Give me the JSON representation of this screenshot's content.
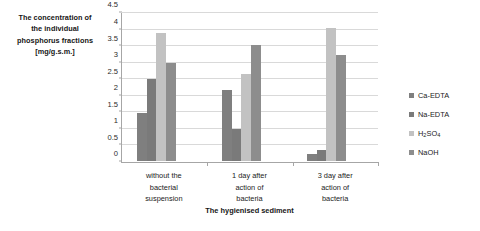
{
  "chart_data": {
    "type": "bar",
    "title": "",
    "subtitle": "",
    "xlabel": "The hygienised sediment",
    "ylabel": "The concentration of the individual phosphorus fractions [mg/g.s.m.]",
    "ylabel_lines": [
      "The concentration of",
      "the individual",
      "phosphorus fractions",
      "[mg/g.s.m.]"
    ],
    "categories": [
      "without the bacterial suspension",
      "1 day after action of bacteria",
      "3 day after action of bacteria"
    ],
    "category_label_lines": [
      [
        "without the",
        "bacterial",
        "suspension"
      ],
      [
        "1 day after",
        "action of",
        "bacteria"
      ],
      [
        "3 day after",
        "action of",
        "bacteria"
      ]
    ],
    "series": [
      {
        "name": "Ca-EDTA",
        "color": "#7f7f7f",
        "values": [
          1.47,
          2.17,
          0.2
        ]
      },
      {
        "name": "Na-EDTA",
        "color": "#7a7a7a",
        "values": [
          2.5,
          0.97,
          0.34
        ]
      },
      {
        "name": "H2SO4",
        "color": "#c2c2c2",
        "values": [
          3.9,
          2.65,
          4.03
        ]
      },
      {
        "name": "NaOH",
        "color": "#8d8d8d",
        "values": [
          2.98,
          3.54,
          3.21
        ]
      }
    ],
    "legend_entries": [
      {
        "label": "Ca-EDTA",
        "html": "Ca-EDTA"
      },
      {
        "label": "Na-EDTA",
        "html": "Na-EDTA"
      },
      {
        "label": "H2SO4",
        "html": "H<sub>2</sub>SO<sub>4</sub>"
      },
      {
        "label": "NaOH",
        "html": "NaOH"
      }
    ],
    "legend_position": "right",
    "ylim": [
      0,
      4.5
    ],
    "ytick_values": [
      0,
      0.5,
      1,
      1.5,
      2,
      2.5,
      3,
      3.5,
      4,
      4.5
    ],
    "ytick_labels": [
      "0",
      "0.5",
      "1",
      "1.5",
      "2",
      "2.5",
      "3",
      "3.5",
      "4",
      "4.5"
    ],
    "grid": true,
    "grid_axis": "y",
    "background_color": "#ffffff",
    "gridline_color": "#d9d9d9",
    "axis_color": "#a6a6a6"
  }
}
